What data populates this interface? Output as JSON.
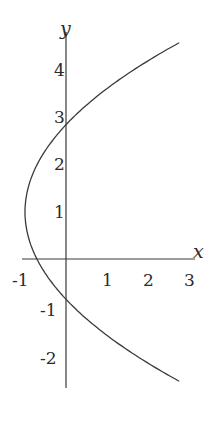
{
  "chart_data": {
    "type": "line",
    "title": "",
    "xlabel": "x",
    "ylabel": "y",
    "xlim": [
      -1.1,
      3.1
    ],
    "ylim": [
      -2.65,
      4.65
    ],
    "grid": false,
    "legend": null,
    "x_ticks": [
      "-1",
      "1",
      "2",
      "3"
    ],
    "y_ticks": [
      "4",
      "3",
      "2",
      "1",
      "-1",
      "-2"
    ],
    "series": [
      {
        "name": "curve",
        "description": "Horizontal parabola opening right, vertex near (-1, 1), crossing y-axis near y=2.85 and y=-0.85",
        "equation_approx": "x = 0.29*(y-1)^2 - 1",
        "points": [
          {
            "x": 3.0,
            "y": 4.6
          },
          {
            "x": 2.0,
            "y": 3.9
          },
          {
            "x": 1.0,
            "y": 3.6
          },
          {
            "x": 0.0,
            "y": 2.85
          },
          {
            "x": -0.6,
            "y": 2.2
          },
          {
            "x": -1.0,
            "y": 1.0
          },
          {
            "x": -0.6,
            "y": -0.2
          },
          {
            "x": 0.0,
            "y": -0.85
          },
          {
            "x": 1.0,
            "y": -1.6
          },
          {
            "x": 2.0,
            "y": -2.1
          },
          {
            "x": 3.0,
            "y": -2.6
          }
        ]
      }
    ]
  }
}
